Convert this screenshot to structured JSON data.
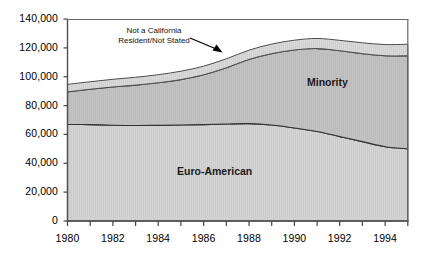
{
  "chart_data": {
    "type": "area",
    "stacked": true,
    "title": "",
    "subtitle": "",
    "xlabel": "",
    "ylabel": "",
    "xlim": [
      1980,
      1995
    ],
    "ylim": [
      0,
      140000
    ],
    "grid": false,
    "legend_position": "inline-annotations",
    "x": [
      1980,
      1981,
      1982,
      1983,
      1984,
      1985,
      1986,
      1987,
      1988,
      1989,
      1990,
      1991,
      1992,
      1993,
      1994,
      1995
    ],
    "x_tick_labels": [
      "1980",
      "1982",
      "1984",
      "1986",
      "1988",
      "1990",
      "1992",
      "1994"
    ],
    "x_ticks": [
      1980,
      1982,
      1984,
      1986,
      1988,
      1990,
      1992,
      1994
    ],
    "y_tick_labels": [
      "0",
      "20,000",
      "40,000",
      "60,000",
      "80,000",
      "100,000",
      "120,000",
      "140,000"
    ],
    "y_ticks": [
      0,
      20000,
      40000,
      60000,
      80000,
      100000,
      120000,
      140000
    ],
    "series": [
      {
        "name": "Euro-American",
        "color": "#d4d4d4",
        "values": [
          67000,
          66800,
          66400,
          66200,
          66300,
          66500,
          66800,
          67200,
          67500,
          66500,
          64500,
          62000,
          58500,
          55000,
          51500,
          50000
        ]
      },
      {
        "name": "Minority",
        "color": "#c2c2c2",
        "values": [
          22500,
          24500,
          26500,
          28000,
          29500,
          31500,
          34500,
          39000,
          44500,
          49500,
          54000,
          57500,
          59500,
          61000,
          63000,
          64500
        ]
      },
      {
        "name": "Not a California Resident/Not Stated",
        "color": "#d9d9d9",
        "values": [
          5200,
          5200,
          5300,
          5400,
          5600,
          5800,
          6000,
          6200,
          6400,
          6600,
          6800,
          7000,
          7200,
          7500,
          7800,
          8000
        ]
      }
    ],
    "annotations": [
      {
        "name": "not-a-california-resident-annotation",
        "text_line1": "Not a California",
        "text_line2": "Resident/Not Stated",
        "target_series": "Not a California Resident/Not Stated"
      },
      {
        "name": "minority-label",
        "text": "Minority"
      },
      {
        "name": "euro-american-label",
        "text": "Euro-American"
      }
    ]
  },
  "axes": {
    "frame_color": "#555555",
    "tick_color": "#444444"
  }
}
